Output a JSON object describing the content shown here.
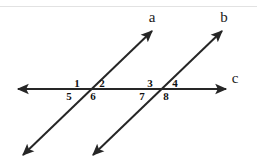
{
  "figure": {
    "stroke_color": "#262626",
    "text_color": "#111111",
    "background_color": "#ffffff",
    "top_rule_color": "#e2e2e2"
  },
  "lines": [
    {
      "id": "line-a",
      "label": "a",
      "label_x": 152,
      "label_y": 22,
      "x1": 23,
      "y1": 155,
      "x2": 152,
      "y2": 31,
      "arrow_start": true,
      "arrow_end": true
    },
    {
      "id": "line-b",
      "label": "b",
      "label_x": 224,
      "label_y": 22,
      "x1": 93,
      "y1": 155,
      "x2": 222,
      "y2": 31,
      "arrow_start": true,
      "arrow_end": true
    },
    {
      "id": "line-c",
      "label": "c",
      "label_x": 235,
      "label_y": 83,
      "x1": 18,
      "y1": 89,
      "x2": 226,
      "y2": 89,
      "arrow_start": true,
      "arrow_end": true
    }
  ],
  "intersections": [
    {
      "id": "intersection-left",
      "x": 89,
      "y": 89,
      "line": "a"
    },
    {
      "id": "intersection-right",
      "x": 162,
      "y": 89,
      "line": "b"
    }
  ],
  "angles": [
    {
      "id": "angle-1",
      "label": "1",
      "x": 77,
      "y": 87,
      "anchor": "middle"
    },
    {
      "id": "angle-2",
      "label": "2",
      "x": 102,
      "y": 87,
      "anchor": "middle"
    },
    {
      "id": "angle-3",
      "label": "3",
      "x": 150,
      "y": 87,
      "anchor": "middle"
    },
    {
      "id": "angle-4",
      "label": "4",
      "x": 175,
      "y": 87,
      "anchor": "middle"
    },
    {
      "id": "angle-5",
      "label": "5",
      "x": 69,
      "y": 100,
      "anchor": "middle"
    },
    {
      "id": "angle-6",
      "label": "6",
      "x": 93,
      "y": 100,
      "anchor": "middle"
    },
    {
      "id": "angle-7",
      "label": "7",
      "x": 142,
      "y": 100,
      "anchor": "middle"
    },
    {
      "id": "angle-8",
      "label": "8",
      "x": 166,
      "y": 100,
      "anchor": "middle"
    }
  ]
}
